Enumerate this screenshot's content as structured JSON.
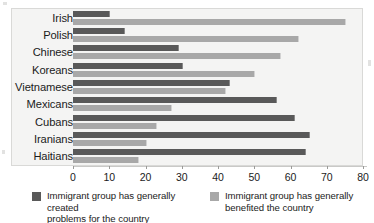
{
  "chart_data": {
    "type": "bar",
    "orientation": "horizontal",
    "title": "",
    "xlabel": "",
    "ylabel": "",
    "xlim": [
      0,
      80
    ],
    "xticks": [
      0,
      10,
      20,
      30,
      40,
      50,
      60,
      70,
      80
    ],
    "grid": false,
    "legend_position": "bottom",
    "categories": [
      "Irish",
      "Polish",
      "Chinese",
      "Koreans",
      "Vietnamese",
      "Mexicans",
      "Cubans",
      "Iranians",
      "Haitians"
    ],
    "series": [
      {
        "name": "Immigrant group has generally created problems for the country",
        "color": "#595959",
        "values": [
          10,
          14,
          29,
          30,
          43,
          56,
          61,
          65,
          64
        ]
      },
      {
        "name": "Immigrant group has generally benefited the country",
        "color": "#a8a8a8",
        "values": [
          75,
          62,
          57,
          50,
          42,
          27,
          23,
          20,
          18
        ]
      }
    ]
  },
  "legend": {
    "entries": [
      {
        "line1": "Immigrant group has generally created",
        "line2": "problems for the country",
        "swatch": "dark"
      },
      {
        "line1": "Immigrant group has generally",
        "line2": "benefited the country",
        "swatch": "light"
      }
    ]
  },
  "colors": {
    "series_dark": "#595959",
    "series_light": "#a8a8a8",
    "plot_background": "#f4f4f3",
    "text": "#1b1b1b"
  }
}
